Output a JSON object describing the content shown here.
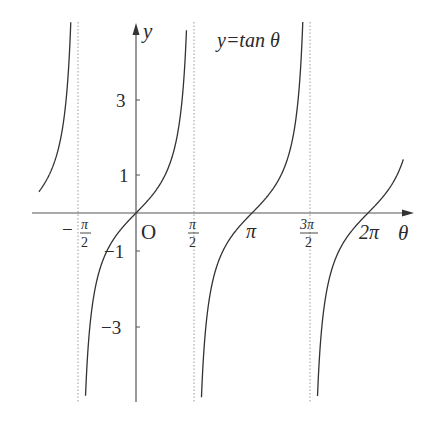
{
  "chart_data": {
    "type": "line",
    "title": "y=tan θ",
    "function": "tan",
    "xlabel": "θ",
    "ylabel": "y",
    "origin_label": "O",
    "x_ticks": [
      {
        "value": -1.5708,
        "label_num": "π",
        "label_den": "2",
        "sign": "−"
      },
      {
        "value": 1.5708,
        "label_num": "π",
        "label_den": "2",
        "sign": ""
      },
      {
        "value": 3.1416,
        "label": "π"
      },
      {
        "value": 4.7124,
        "label_num": "3π",
        "label_den": "2",
        "sign": ""
      },
      {
        "value": 6.2832,
        "label": "2π"
      }
    ],
    "y_ticks": [
      {
        "value": 3,
        "label": "3"
      },
      {
        "value": 1,
        "label": "1"
      },
      {
        "value": -1,
        "label": "−1"
      },
      {
        "value": -3,
        "label": "−3"
      }
    ],
    "asymptotes": [
      -1.5708,
      1.5708,
      4.7124
    ],
    "xlim": [
      -2.63,
      7.24
    ],
    "ylim": [
      -5.0,
      5.0
    ],
    "grid": false,
    "series": [
      {
        "name": "tan θ branch 1",
        "x_range": [
          -2.63,
          -1.61
        ]
      },
      {
        "name": "tan θ branch 2",
        "x_range": [
          -1.53,
          1.53
        ]
      },
      {
        "name": "tan θ branch 3",
        "x_range": [
          1.61,
          4.67
        ]
      },
      {
        "name": "tan θ branch 4",
        "x_range": [
          4.75,
          7.24
        ]
      }
    ]
  },
  "labels": {
    "title": "y=tan θ",
    "y_axis": "y",
    "x_axis": "θ",
    "origin": "O",
    "y3": "3",
    "y1": "1",
    "ym1": "−1",
    "ym3": "−3",
    "pi": "π",
    "two_pi": "2π",
    "pi_frac": "π",
    "three_pi_frac": "3π",
    "den": "2",
    "minus": "−"
  }
}
